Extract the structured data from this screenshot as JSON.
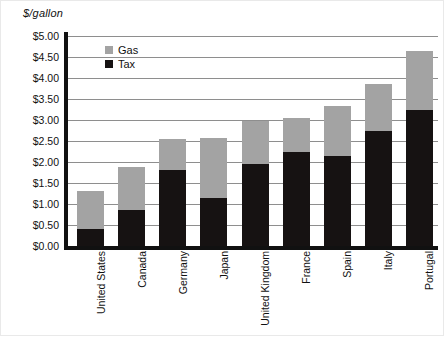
{
  "chart_data": {
    "type": "bar",
    "subtype": "stacked-vertical",
    "title": "",
    "xlabel": "",
    "ylabel": "$/gallon",
    "ylim": [
      0,
      5
    ],
    "ytick_step": 0.5,
    "ytick_labels": [
      "$5.00",
      "$4.50",
      "$4.00",
      "$3.50",
      "$3.00",
      "$2.50",
      "$2.00",
      "$1.50",
      "$1.00",
      "$0.50",
      "$0.00"
    ],
    "grid": true,
    "grid_axis": "y",
    "legend_position": "inside-upper-left",
    "categories": [
      "United States",
      "Canada",
      "Germany",
      "Japan",
      "United Kingdom",
      "France",
      "Spain",
      "Italy",
      "Portugal"
    ],
    "series": [
      {
        "name": "Tax",
        "color": "#161212",
        "values": [
          0.4,
          0.85,
          1.82,
          1.15,
          1.95,
          2.25,
          2.15,
          2.75,
          3.25
        ]
      },
      {
        "name": "Gas",
        "color": "#a3a3a3",
        "values": [
          0.9,
          1.03,
          0.73,
          1.43,
          1.02,
          0.8,
          1.18,
          1.1,
          1.4
        ]
      }
    ],
    "totals": [
      1.3,
      1.88,
      2.55,
      2.58,
      2.97,
      3.05,
      3.33,
      3.85,
      4.65
    ]
  },
  "legend": {
    "items": [
      {
        "label": "Gas",
        "color": "#a3a3a3"
      },
      {
        "label": "Tax",
        "color": "#161212"
      }
    ]
  }
}
